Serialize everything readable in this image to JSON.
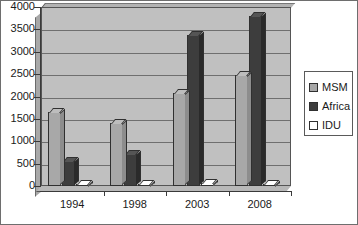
{
  "chart_data": {
    "type": "bar",
    "title": "",
    "subtitle": "",
    "xlabel": "",
    "ylabel": "",
    "categories": [
      "1994",
      "1998",
      "2003",
      "2008"
    ],
    "series": [
      {
        "name": "MSM",
        "values": [
          1650,
          1400,
          2080,
          2480
        ],
        "color": "#a8a8a8"
      },
      {
        "name": "Africa",
        "values": [
          550,
          720,
          3380,
          3800
        ],
        "color": "#3d3d3d"
      },
      {
        "name": "IDU",
        "values": [
          40,
          50,
          60,
          50
        ],
        "color": "#ffffff"
      }
    ],
    "ylim": [
      0,
      4000
    ],
    "ytick_step": 500,
    "yticks": [
      "0",
      "500",
      "1000",
      "1500",
      "2000",
      "2500",
      "3000",
      "3500",
      "4000"
    ],
    "grid": true,
    "legend_position": "right",
    "style": "3d-columns-grayscale",
    "plot_background": "#c0c0c0",
    "figure_background": "#ffffff",
    "border_color": "#6e6e6e"
  },
  "legend": {
    "entries": [
      {
        "label": "MSM"
      },
      {
        "label": "Africa"
      },
      {
        "label": "IDU"
      }
    ]
  }
}
